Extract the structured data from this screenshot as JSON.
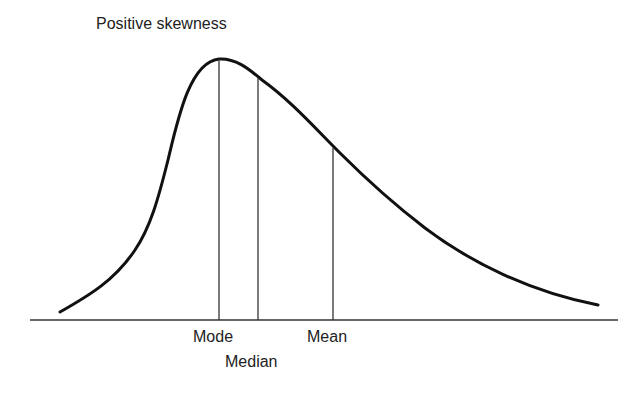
{
  "diagram": {
    "title": "Positive skewness",
    "labels": {
      "mode": "Mode",
      "median": "Median",
      "mean": "Mean"
    },
    "colors": {
      "curve": "#111111",
      "lines": "#333333",
      "text": "#222222",
      "background": "#ffffff"
    }
  }
}
